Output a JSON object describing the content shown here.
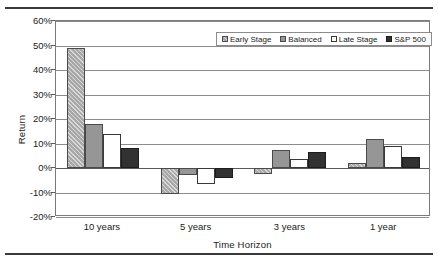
{
  "chart_data": {
    "type": "bar",
    "title": "",
    "xlabel": "Time Horizon",
    "ylabel": "Return",
    "categories": [
      "10 years",
      "5 years",
      "3 years",
      "1 year"
    ],
    "ylim": [
      -20,
      60
    ],
    "ytick_labels": [
      "60%",
      "50%",
      "40%",
      "30%",
      "20%",
      "10%",
      "0%",
      "-10%",
      "-20%"
    ],
    "ytick_values": [
      60,
      50,
      40,
      30,
      20,
      10,
      0,
      -10,
      -20
    ],
    "grid": true,
    "legend_position": "top-right",
    "series": [
      {
        "name": "Early Stage",
        "color": "#a8a8a8",
        "pattern": "hatched",
        "values": [
          49,
          -10.5,
          -2.5,
          2
        ]
      },
      {
        "name": "Balanced",
        "color": "#969696",
        "pattern": "solid",
        "values": [
          18,
          -3,
          7.5,
          12
        ]
      },
      {
        "name": "Late Stage",
        "color": "#ffffff",
        "pattern": "solid",
        "values": [
          14,
          -6.5,
          3.5,
          9
        ]
      },
      {
        "name": "S&P 500",
        "color": "#323232",
        "pattern": "solid",
        "values": [
          8,
          -4,
          6.5,
          4.5
        ]
      }
    ]
  }
}
